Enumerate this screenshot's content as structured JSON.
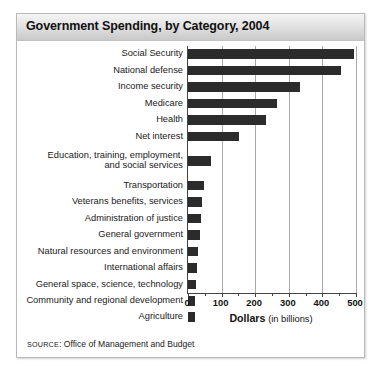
{
  "figure": {
    "title": "Government Spending, by Category, 2004",
    "source_prefix": "SOURCE",
    "source_sep": ": ",
    "source_text": "Office of Management and Budget",
    "axis_title_main": "Dollars",
    "axis_title_sub": "(in billions)",
    "bar_color": "#2b2b2b",
    "grid_color": "#a8a8a8",
    "axis_color": "#444444",
    "header_bg": "#dcdcdc"
  },
  "chart_data": {
    "type": "bar",
    "orientation": "horizontal",
    "title": "Government Spending, by Category, 2004",
    "xlabel": "Dollars (in billions)",
    "ylabel": "",
    "xlim": [
      0,
      500
    ],
    "xticks": [
      0,
      100,
      200,
      300,
      400,
      500
    ],
    "xtick_labels": [
      "0",
      "100",
      "200",
      "300",
      "400",
      "500"
    ],
    "minor_xticks": [
      50,
      150,
      250,
      350,
      450
    ],
    "grid": true,
    "legend": false,
    "categories": [
      "Social Security",
      "National defense",
      "Income security",
      "Medicare",
      "Health",
      "Net interest",
      "Education, training, employment,\nand social services",
      "Transportation",
      "Veterans benefits, services",
      "Administration of justice",
      "General government",
      "Natural resources and environment",
      "International affairs",
      "General space, science, technology",
      "Community and regional development",
      "Agriculture"
    ],
    "values": [
      495,
      456,
      334,
      265,
      232,
      152,
      68,
      47,
      43,
      38,
      37,
      30,
      27,
      24,
      21,
      20
    ],
    "units": "billions of dollars",
    "year": 2004
  }
}
